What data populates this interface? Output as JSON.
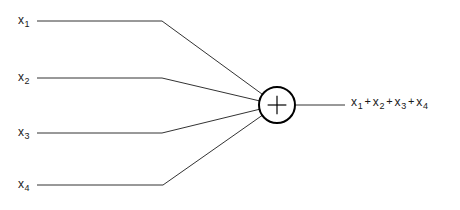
{
  "diagram": {
    "node": {
      "symbol": "+",
      "name": "summing-junction",
      "center_x": 277,
      "center_y": 105,
      "radius": 18,
      "stroke_color": "#000000",
      "stroke_width": 2
    },
    "inputs": [
      {
        "label_base": "x",
        "label_sub": "1",
        "label_x": 18,
        "label_y": 14,
        "wire_y": 21,
        "bend_x": 162
      },
      {
        "label_base": "x",
        "label_sub": "2",
        "label_x": 18,
        "label_y": 71,
        "wire_y": 78,
        "bend_x": 162
      },
      {
        "label_base": "x",
        "label_sub": "3",
        "label_x": 18,
        "label_y": 126,
        "wire_y": 133,
        "bend_x": 162
      },
      {
        "label_base": "x",
        "label_sub": "4",
        "label_x": 18,
        "label_y": 178,
        "wire_y": 185,
        "bend_x": 163
      }
    ],
    "wire": {
      "start_x": 37,
      "color": "#333333",
      "width": 1
    },
    "output": {
      "wire_y": 105,
      "wire_start_x": 296,
      "wire_end_x": 345,
      "expression_terms": [
        {
          "base": "x",
          "sub": "1"
        },
        {
          "base": "x",
          "sub": "2"
        },
        {
          "base": "x",
          "sub": "3"
        },
        {
          "base": "x",
          "sub": "4"
        }
      ],
      "operator": "+",
      "expression_text": "x1 + x2 + x3 + x4",
      "clipped_at_right_edge": true
    },
    "colors": {
      "background": "#ffffff",
      "ink": "#1a1a1a",
      "wire": "#333333"
    }
  }
}
